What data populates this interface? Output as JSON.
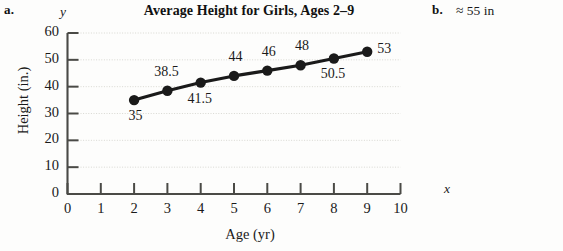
{
  "parts": {
    "a_label": "a.",
    "b_label": "b.",
    "b_answer": "≈ 55 in"
  },
  "chart_data": {
    "type": "line",
    "title": "Average Height for Girls, Ages 2–9",
    "xlabel": "Age (yr)",
    "ylabel": "Height (in.)",
    "x_axis_symbol": "x",
    "y_axis_symbol": "y",
    "x": [
      2,
      3,
      4,
      5,
      6,
      7,
      8,
      9
    ],
    "values": [
      35,
      38.5,
      41.5,
      44,
      46,
      48,
      50.5,
      53
    ],
    "point_labels": [
      "35",
      "38.5",
      "41.5",
      "44",
      "46",
      "48",
      "50.5",
      "53"
    ],
    "xlim": [
      0,
      10
    ],
    "ylim": [
      0,
      60
    ],
    "xticks": [
      "0",
      "1",
      "2",
      "3",
      "4",
      "5",
      "6",
      "7",
      "8",
      "9",
      "10"
    ],
    "yticks": [
      "0",
      "10",
      "20",
      "30",
      "40",
      "50",
      "60"
    ],
    "grid": true,
    "legend": "none",
    "marker": "filled-circle",
    "line_color": "#1a1a1a",
    "marker_color": "#1a1a1a",
    "grid_color": "#d8d8d2"
  }
}
